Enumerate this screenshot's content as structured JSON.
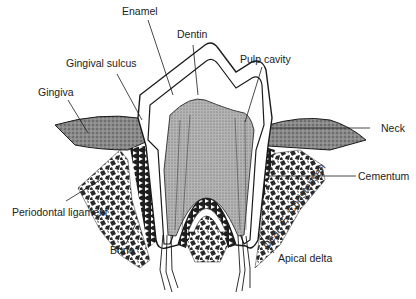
{
  "labels": {
    "enamel": "Enamel",
    "dentin": "Dentin",
    "gingival_sulcus": "Gingival sulcus",
    "pulp_cavity": "Pulp cavity",
    "gingiva": "Gingiva",
    "neck": "Neck",
    "cementum": "Cementum",
    "periodontal_ligament": "Periodontal ligament",
    "bone": "Bone",
    "apical_delta": "Apical delta"
  },
  "signature": "Dean E. Christensen",
  "colors": {
    "line": "#1a1a1a",
    "gum": "#6e6e6e",
    "pulp": "#9a9a9a",
    "bone_dark": "#2a2a2a",
    "background": "#ffffff"
  }
}
